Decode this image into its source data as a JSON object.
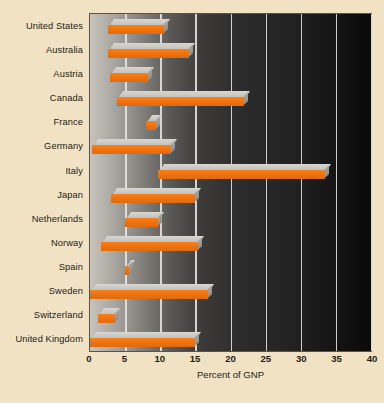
{
  "chart_data": {
    "type": "bar",
    "orientation": "horizontal",
    "subtype": "floating-range-bar-3d",
    "title": "",
    "subtitle": "",
    "xlabel": "Percent of GNP",
    "ylabel": "",
    "xlim": [
      0,
      40
    ],
    "xticks": [
      0,
      5,
      10,
      15,
      20,
      25,
      30,
      35,
      40
    ],
    "xtick_labels": [
      "0",
      "5",
      "10",
      "15",
      "20",
      "25",
      "30",
      "35",
      "40"
    ],
    "grid": true,
    "grid_axis": "x",
    "legend": false,
    "categories": [
      "United States",
      "Australia",
      "Austria",
      "Canada",
      "France",
      "Germany",
      "Italy",
      "Japan",
      "Netherlands",
      "Norway",
      "Spain",
      "Sweden",
      "Switzerland",
      "United Kingdom"
    ],
    "series": [
      {
        "name": "Percent of GNP range",
        "type": "range",
        "start_values": [
          2.6,
          2.6,
          2.8,
          3.8,
          8.0,
          0.3,
          9.7,
          3.0,
          5.0,
          1.6,
          5.0,
          0.0,
          1.2,
          0.0
        ],
        "end_values": [
          10.6,
          14.1,
          8.2,
          21.9,
          9.4,
          11.5,
          33.5,
          15.0,
          9.7,
          15.4,
          5.5,
          16.8,
          3.5,
          15.0
        ]
      }
    ],
    "colors": {
      "bar_front": "#ef7411",
      "bar_top": "#c8c7c2",
      "gridline": "#e9e7e2",
      "page_background": "#f2e2c4",
      "plot_gradient_left": "#c6c3bc",
      "plot_gradient_right": "#0a0a0a",
      "text": "#231c14",
      "plot_border": "#5d5243"
    }
  }
}
